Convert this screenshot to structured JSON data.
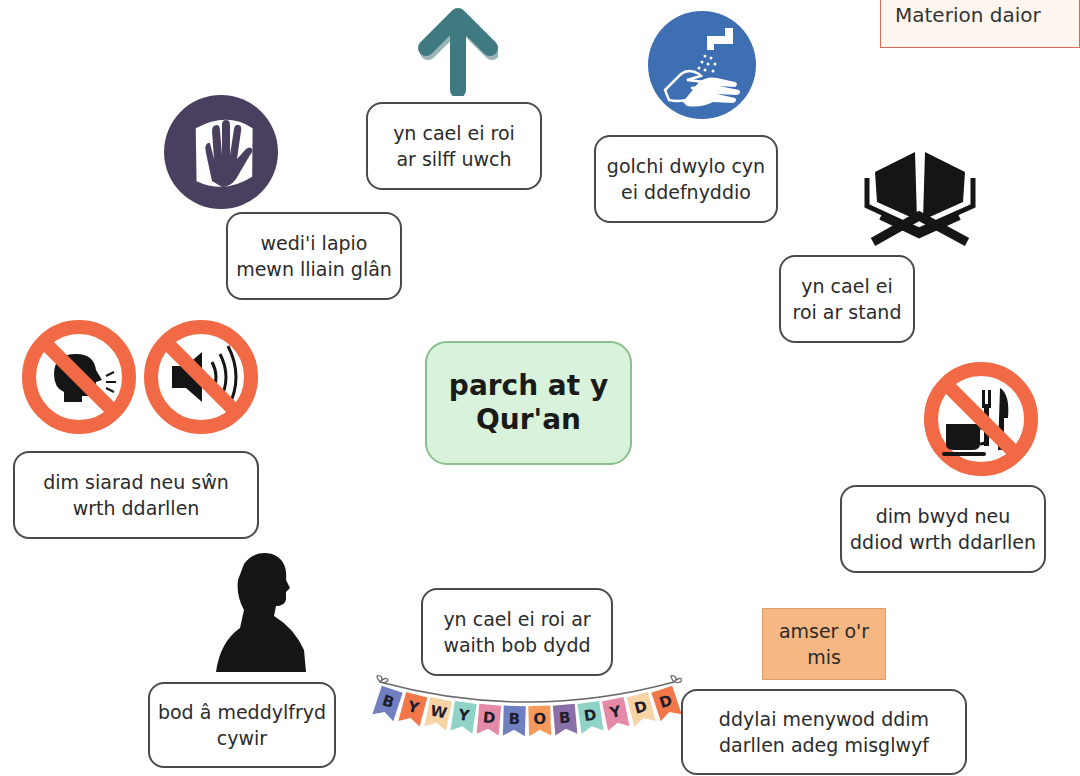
{
  "corner_note": {
    "text": "Materion daior"
  },
  "center": {
    "label": "parch at y\nQur'an",
    "color": "#d9f2dc"
  },
  "nodes": [
    {
      "id": "wrapped",
      "label": "wedi'i lapio\nmewn lliain glân",
      "icon": "hand-in-cloth-icon"
    },
    {
      "id": "high-shelf",
      "label": "yn cael ei roi\nar silff uwch",
      "icon": "arrow-up-icon"
    },
    {
      "id": "wash-hands",
      "label": "golchi dwylo cyn\nei ddefnyddio",
      "icon": "hand-washing-icon"
    },
    {
      "id": "stand",
      "label": "yn cael ei\nroi ar stand",
      "icon": "quran-stand-icon"
    },
    {
      "id": "no-talking",
      "label": "dim siarad neu sŵn\nwrth ddarllen",
      "icon": "no-talking-icon"
    },
    {
      "id": "no-food",
      "label": "dim bwyd neu\nddiod wrth ddarllen",
      "icon": "no-food-drink-icon"
    },
    {
      "id": "mindset",
      "label": "bod â meddylfryd\ncywir",
      "icon": "person-silhouette-icon"
    },
    {
      "id": "daily",
      "label": "yn cael ei roi ar\nwaith bob dydd",
      "icon": "bunting-icon"
    },
    {
      "id": "menstruation",
      "label": "ddylai menywod ddim\ndarllen adeg misglwyf",
      "icon": "none"
    }
  ],
  "orange_note": {
    "label": "amser o'r\nmis",
    "color": "#f6b782"
  },
  "bunting": {
    "letters": [
      "B",
      "Y",
      "W",
      "Y",
      "D",
      "B",
      "O",
      "B",
      "D",
      "Y",
      "D",
      "D"
    ],
    "colors": [
      "#6f7fbf",
      "#f2784b",
      "#f8d3a5",
      "#8fd3c7",
      "#e58aa6",
      "#6f7fbf",
      "#f69a5b",
      "#8a6fa8",
      "#8fd3c7",
      "#e58aa6",
      "#f8d3a5",
      "#f2784b"
    ]
  },
  "colors": {
    "prohibition_red": "#f26a45",
    "mandatory_blue": "#3f6fb3",
    "arrow_teal": "#3f7a80",
    "hand_circle": "#4a3f5e"
  }
}
